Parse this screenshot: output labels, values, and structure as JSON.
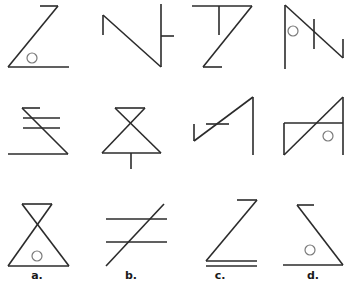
{
  "puzzle": {
    "type": "visual-analogy-matrix",
    "rows": [
      {
        "cells": [
          {
            "name": "figure-z-circle",
            "lines": [
              [
                40,
                6,
                58,
                6
              ],
              [
                58,
                6,
                8,
                67
              ],
              [
                8,
                67,
                69,
                67
              ]
            ],
            "circles": [
              [
                32,
                58,
                5
              ]
            ]
          },
          {
            "name": "figure-n-tick",
            "lines": [
              [
                103,
                35,
                103,
                15
              ],
              [
                103,
                15,
                161,
                67
              ],
              [
                161,
                67,
                161,
                4
              ],
              [
                161,
                36,
                174,
                36
              ]
            ],
            "circles": []
          },
          {
            "name": "figure-t-z",
            "lines": [
              [
                192,
                6,
                252,
                6
              ],
              [
                219,
                6,
                219,
                35
              ],
              [
                252,
                6,
                203,
                67
              ],
              [
                203,
                67,
                222,
                67
              ]
            ],
            "circles": []
          },
          {
            "name": "figure-flag-n",
            "lines": [
              [
                285,
                69,
                285,
                5
              ],
              [
                285,
                5,
                343,
                58
              ],
              [
                343,
                58,
                343,
                39
              ],
              [
                314,
                19,
                314,
                49
              ]
            ],
            "circles": [
              [
                293,
                31,
                5
              ]
            ]
          }
        ]
      },
      {
        "cells": [
          {
            "name": "figure-sigma-bars",
            "lines": [
              [
                22,
                108,
                40,
                108
              ],
              [
                22,
                108,
                68,
                154
              ],
              [
                68,
                154,
                8,
                154
              ],
              [
                23,
                118,
                60,
                118
              ],
              [
                23,
                128,
                60,
                128
              ]
            ],
            "circles": []
          },
          {
            "name": "figure-hourglass-stem",
            "lines": [
              [
                115,
                108,
                145,
                108
              ],
              [
                115,
                108,
                161,
                153
              ],
              [
                145,
                108,
                102,
                153
              ],
              [
                102,
                153,
                161,
                153
              ],
              [
                131,
                153,
                131,
                169
              ]
            ],
            "circles": []
          },
          {
            "name": "figure-slash-lightning",
            "lines": [
              [
                194,
                141,
                194,
                124
              ],
              [
                194,
                141,
                253,
                97
              ],
              [
                253,
                97,
                253,
                155
              ],
              [
                206,
                124,
                229,
                124
              ]
            ],
            "circles": []
          },
          {
            "name": "figure-box-slash",
            "lines": [
              [
                284,
                155,
                343,
                97
              ],
              [
                343,
                97,
                343,
                155
              ],
              [
                284,
                155,
                284,
                123
              ],
              [
                284,
                123,
                343,
                123
              ]
            ],
            "circles": [
              [
                328,
                136,
                5
              ]
            ]
          }
        ]
      },
      {
        "cells": [
          {
            "name": "option-a-hourglass-circle",
            "lines": [
              [
                22,
                204,
                52,
                204
              ],
              [
                22,
                204,
                69,
                266
              ],
              [
                52,
                204,
                8,
                266
              ],
              [
                8,
                266,
                69,
                266
              ]
            ],
            "circles": [
              [
                37,
                256,
                5
              ]
            ]
          },
          {
            "name": "option-b-slash-bars",
            "lines": [
              [
                106,
                219,
                167,
                219
              ],
              [
                106,
                242,
                167,
                242
              ],
              [
                106,
                266,
                164,
                204
              ]
            ],
            "circles": []
          },
          {
            "name": "option-c-z-double",
            "lines": [
              [
                237,
                200,
                257,
                200
              ],
              [
                257,
                200,
                206,
                261
              ],
              [
                206,
                261,
                257,
                261
              ],
              [
                206,
                266,
                257,
                266
              ]
            ],
            "circles": []
          },
          {
            "name": "option-d-sigma-circle",
            "lines": [
              [
                297,
                205,
                314,
                205
              ],
              [
                297,
                205,
                343,
                265
              ],
              [
                343,
                265,
                283,
                265
              ]
            ],
            "circles": [
              [
                310,
                250,
                5
              ]
            ]
          }
        ]
      }
    ],
    "options": [
      {
        "key": "a",
        "label": "a.",
        "x": 37,
        "y": 270
      },
      {
        "key": "b",
        "label": "b.",
        "x": 131,
        "y": 270
      },
      {
        "key": "c",
        "label": "c.",
        "x": 220,
        "y": 270
      },
      {
        "key": "d",
        "label": "d.",
        "x": 313,
        "y": 270
      }
    ],
    "colors": {
      "line": "#2b2b2b",
      "circle": "#7a7a7a",
      "background": "#ffffff"
    }
  }
}
